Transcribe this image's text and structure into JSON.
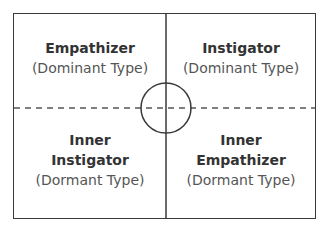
{
  "diagram": {
    "type": "quadrant",
    "quadrants": {
      "top_left": {
        "title_lines": [
          "Empathizer"
        ],
        "subtitle": "(Dominant Type)"
      },
      "top_right": {
        "title_lines": [
          "Instigator"
        ],
        "subtitle": "(Dominant Type)"
      },
      "bottom_left": {
        "title_lines": [
          "Inner",
          "Instigator"
        ],
        "subtitle": "(Dormant Type)"
      },
      "bottom_right": {
        "title_lines": [
          "Inner",
          "Empathizer"
        ],
        "subtitle": "(Dormant Type)"
      }
    },
    "axes": {
      "vertical": "solid",
      "horizontal": "dashed",
      "center_marker": "crosshair-circle"
    },
    "colors": {
      "line": "#3a3a3a",
      "title_text": "#333333",
      "subtitle_text": "#555555",
      "background": "#ffffff"
    }
  }
}
